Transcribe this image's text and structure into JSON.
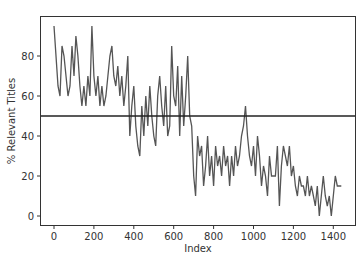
{
  "chart_data": {
    "type": "line",
    "title": "",
    "xlabel": "Index",
    "ylabel": "% Relevant Titles",
    "xlim": [
      -75,
      1510
    ],
    "ylim": [
      -5,
      100
    ],
    "xticks": [
      0,
      200,
      400,
      600,
      800,
      1000,
      1200,
      1400
    ],
    "yticks": [
      0,
      20,
      40,
      60,
      80
    ],
    "grid": false,
    "legend": null,
    "colors": {
      "series": "#555555",
      "hline": "#222222",
      "frame": "#333333"
    },
    "hline": {
      "y": 50,
      "label": ""
    },
    "series": [
      {
        "name": "% Relevant Titles",
        "x": [
          0,
          10,
          20,
          30,
          40,
          50,
          60,
          70,
          80,
          90,
          100,
          110,
          120,
          130,
          140,
          150,
          160,
          170,
          180,
          190,
          200,
          210,
          220,
          230,
          240,
          250,
          260,
          270,
          280,
          290,
          300,
          310,
          320,
          330,
          340,
          350,
          360,
          370,
          380,
          390,
          400,
          410,
          420,
          430,
          440,
          450,
          460,
          470,
          480,
          490,
          500,
          510,
          520,
          530,
          540,
          550,
          560,
          570,
          580,
          590,
          600,
          610,
          620,
          630,
          640,
          650,
          660,
          670,
          680,
          690,
          700,
          710,
          720,
          730,
          740,
          750,
          760,
          770,
          780,
          790,
          800,
          810,
          820,
          830,
          840,
          850,
          860,
          870,
          880,
          890,
          900,
          910,
          920,
          930,
          940,
          950,
          960,
          970,
          980,
          990,
          1000,
          1010,
          1020,
          1030,
          1040,
          1050,
          1060,
          1070,
          1080,
          1090,
          1100,
          1110,
          1120,
          1130,
          1140,
          1150,
          1160,
          1170,
          1180,
          1190,
          1200,
          1210,
          1220,
          1230,
          1240,
          1250,
          1260,
          1270,
          1280,
          1290,
          1300,
          1310,
          1320,
          1330,
          1340,
          1350,
          1360,
          1370,
          1380,
          1390,
          1400,
          1410,
          1420,
          1430,
          1440
        ],
        "values": [
          95,
          80,
          65,
          60,
          85,
          80,
          70,
          60,
          65,
          85,
          70,
          90,
          80,
          65,
          55,
          65,
          55,
          70,
          60,
          95,
          70,
          60,
          70,
          55,
          65,
          55,
          60,
          70,
          80,
          85,
          70,
          65,
          75,
          60,
          70,
          55,
          65,
          80,
          40,
          55,
          65,
          45,
          35,
          30,
          55,
          40,
          60,
          45,
          65,
          50,
          40,
          35,
          60,
          70,
          55,
          45,
          65,
          40,
          45,
          85,
          60,
          55,
          75,
          40,
          70,
          45,
          60,
          80,
          50,
          45,
          20,
          10,
          40,
          30,
          35,
          15,
          25,
          40,
          20,
          30,
          15,
          35,
          25,
          30,
          20,
          35,
          25,
          30,
          15,
          30,
          20,
          35,
          25,
          30,
          40,
          45,
          55,
          40,
          30,
          25,
          35,
          20,
          40,
          30,
          15,
          25,
          20,
          10,
          30,
          20,
          20,
          20,
          35,
          5,
          25,
          35,
          30,
          25,
          35,
          20,
          25,
          15,
          10,
          20,
          15,
          15,
          10,
          20,
          10,
          15,
          10,
          5,
          15,
          0,
          10,
          20,
          10,
          5,
          10,
          0,
          10,
          20,
          15,
          15,
          15
        ]
      }
    ]
  }
}
